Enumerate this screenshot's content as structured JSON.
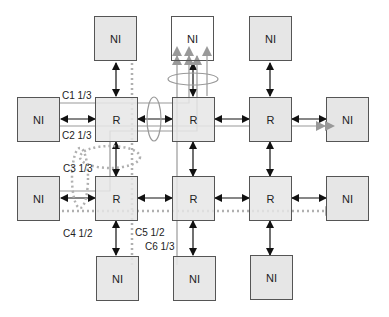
{
  "diagram": {
    "type": "network-on-chip mesh",
    "router_label": "R",
    "ni_label": "NI",
    "nodes": {
      "ni_top_1": "NI",
      "ni_top_2": "NI",
      "ni_top_3": "NI",
      "ni_left_1": "NI",
      "ni_left_2": "NI",
      "ni_right_1": "NI",
      "ni_right_2": "NI",
      "ni_bottom_1": "NI",
      "ni_bottom_2": "NI",
      "ni_bottom_3": "NI",
      "r_1_1": "R",
      "r_1_2": "R",
      "r_1_3": "R",
      "r_2_1": "R",
      "r_2_2": "R",
      "r_2_3": "R"
    },
    "connections": [
      {
        "id": "c1",
        "label": "C1 1/3",
        "style": "solid"
      },
      {
        "id": "c2",
        "label": "C2 1/3",
        "style": "solid"
      },
      {
        "id": "c3",
        "label": "C3 1/3",
        "style": "solid"
      },
      {
        "id": "c4",
        "label": "C4 1/2",
        "style": "dotted"
      },
      {
        "id": "c5",
        "label": "C5 1/2",
        "style": "dotted"
      },
      {
        "id": "c6",
        "label": "C6 1/3",
        "style": "solid"
      }
    ],
    "colors": {
      "box_fill": "#e6e6e6",
      "box_border": "#555555",
      "link_arrow": "#111111",
      "connection_line": "#999999",
      "dotted_line": "#b0b0b0"
    }
  }
}
